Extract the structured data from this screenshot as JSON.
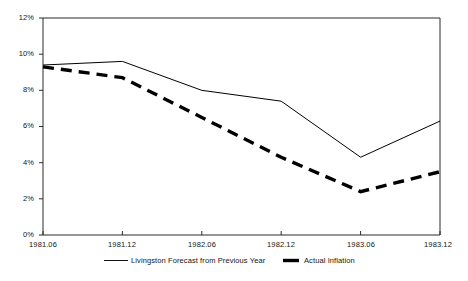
{
  "chart_data": {
    "type": "line",
    "title": "",
    "xlabel": "",
    "ylabel": "",
    "categories": [
      "1981.06",
      "1981.12",
      "1982.06",
      "1982.12",
      "1983.06",
      "1983.12"
    ],
    "ylim": [
      0,
      12
    ],
    "ytick_labels": [
      "12%",
      "10%",
      "8%",
      "6%",
      "4%",
      "2%",
      "0%"
    ],
    "ytick_values": [
      12,
      10,
      8,
      6,
      4,
      2,
      0
    ],
    "grid": false,
    "legend_position": "bottom",
    "series": [
      {
        "name": "Livingston Forecast from Previous Year",
        "style": "solid",
        "color": "#000000",
        "values": [
          9.4,
          9.6,
          8.0,
          7.4,
          4.3,
          6.3
        ]
      },
      {
        "name": "Actual Inflation",
        "style": "dashed",
        "color": "#000000",
        "values": [
          9.3,
          8.7,
          6.5,
          4.3,
          2.4,
          3.5
        ]
      }
    ]
  },
  "axis": {
    "y_ticks": [
      {
        "label": "12%"
      },
      {
        "label": "10%"
      },
      {
        "label": "8%"
      },
      {
        "label": "6%"
      },
      {
        "label": "4%"
      },
      {
        "label": "2%"
      },
      {
        "label": "0%"
      }
    ],
    "x_ticks": [
      {
        "label": "1981.06"
      },
      {
        "label": "1981.12"
      },
      {
        "label": "1982.06"
      },
      {
        "label": "1982.12"
      },
      {
        "label": "1983.06"
      },
      {
        "label": "1983.12"
      }
    ]
  },
  "legend": {
    "items": [
      {
        "label": "Livingston Forecast from Previous Year",
        "style": "solid"
      },
      {
        "label": "Actual Inflation",
        "style": "dashed"
      }
    ]
  }
}
